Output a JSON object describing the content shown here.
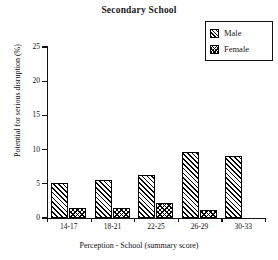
{
  "chart_data": {
    "type": "bar",
    "title": "Secondary School",
    "xlabel": "Perception - School (summary score)",
    "ylabel": "Potential for serious disruption (%)",
    "categories": [
      "14-17",
      "18-21",
      "22-25",
      "26-29",
      "30-33"
    ],
    "series": [
      {
        "name": "Male",
        "values": [
          5.1,
          5.5,
          6.3,
          9.6,
          9.1
        ]
      },
      {
        "name": "Female",
        "values": [
          1.5,
          1.4,
          2.2,
          1.2,
          0.0
        ]
      }
    ],
    "ylim": [
      0,
      25
    ],
    "yticks": [
      0,
      5,
      10,
      15,
      20,
      25
    ],
    "ytick_labels": [
      "0",
      "5",
      "10",
      "15",
      "20",
      "25"
    ],
    "grid": false,
    "legend_position": "top-right",
    "legend_entries": [
      "Male",
      "Female"
    ],
    "colors": {
      "series_male_fill": "#ffffff",
      "series_female_fill": "#ffffff",
      "outline": "#000000",
      "text": "#111111",
      "background": "#ffffff"
    },
    "patterns": {
      "male": "diagonal-hatch",
      "female": "cross-hatch"
    }
  }
}
